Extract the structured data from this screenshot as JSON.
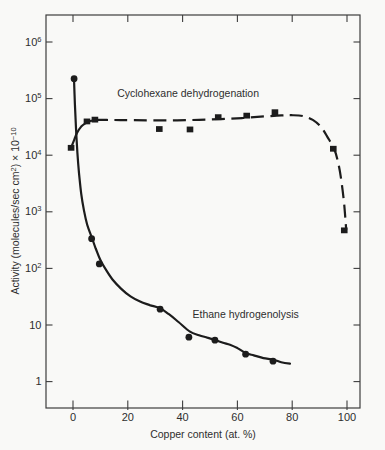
{
  "chart_data": {
    "type": "scatter-line",
    "title": "",
    "xlabel": "Copper content (at. %)",
    "ylabel_parts": [
      {
        "t": "Activity (molecules/sec cm",
        "sup": false
      },
      {
        "t": "2",
        "sup": true
      },
      {
        "t": ")  ×  10",
        "sup": false
      },
      {
        "t": "−10",
        "sup": true
      }
    ],
    "x_axis": {
      "ticks": [
        0,
        20,
        40,
        60,
        80,
        100
      ],
      "labels": [
        "0",
        "20",
        "40",
        "60",
        "80",
        "100"
      ]
    },
    "y_axis": {
      "scale": "log",
      "ticks": [
        {
          "log": 6,
          "text": "10",
          "sup": "6"
        },
        {
          "log": 5,
          "text": "10",
          "sup": "5"
        },
        {
          "log": 4,
          "text": "10",
          "sup": "4"
        },
        {
          "log": 3,
          "text": "10",
          "sup": "3"
        },
        {
          "log": 2,
          "text": "10",
          "sup": "2"
        },
        {
          "log": 1,
          "text": "10",
          "sup": ""
        },
        {
          "log": 0,
          "text": "1",
          "sup": ""
        }
      ]
    },
    "xlim": [
      -9.8,
      104.7
    ],
    "ylog_lim": [
      -0.46,
      6.48
    ],
    "grid": false,
    "legend": "inline-annotations",
    "series": [
      {
        "name": "Cyclohexane dehydrogenation",
        "marker": "square",
        "line_style": "solid-then-dashed",
        "points": [
          [
            -0.7,
            13500
          ],
          [
            5.1,
            39500
          ],
          [
            8,
            42500
          ],
          [
            31.5,
            29000
          ],
          [
            42.7,
            28500
          ],
          [
            53,
            47000
          ],
          [
            63.4,
            50000
          ],
          [
            73.7,
            57500
          ],
          [
            95,
            13000
          ],
          [
            99,
            470
          ]
        ],
        "curve_solid": [
          [
            -0.7,
            13500
          ],
          [
            0.5,
            19000
          ],
          [
            1.5,
            25000
          ],
          [
            3,
            32000
          ],
          [
            4.5,
            36500
          ],
          [
            6,
            39500
          ],
          [
            8,
            42000
          ]
        ],
        "curve_dashed": [
          [
            8,
            42000
          ],
          [
            15,
            41800
          ],
          [
            22,
            41500
          ],
          [
            30,
            41200
          ],
          [
            38,
            41200
          ],
          [
            46,
            42200
          ],
          [
            54,
            43500
          ],
          [
            62,
            45500
          ],
          [
            70,
            48500
          ],
          [
            76,
            50500
          ],
          [
            80,
            51000
          ],
          [
            84,
            49000
          ],
          [
            87.5,
            42000
          ],
          [
            90.5,
            31500
          ],
          [
            93,
            20500
          ],
          [
            95.3,
            13000
          ],
          [
            96.8,
            7300
          ],
          [
            98,
            3400
          ],
          [
            99,
            1300
          ],
          [
            99.7,
            480
          ]
        ],
        "label": {
          "text": "Cyclohexane dehydrogenation",
          "x": 42,
          "y": 105000
        }
      },
      {
        "name": "Ethane hydrogenolysis",
        "marker": "circle",
        "line_style": "solid",
        "points": [
          [
            0.4,
            225000
          ],
          [
            6.8,
            335
          ],
          [
            9.6,
            120
          ],
          [
            31.8,
            19
          ],
          [
            42.3,
            6.1
          ],
          [
            51.8,
            5.4
          ],
          [
            63,
            3.05
          ],
          [
            73,
            2.3
          ]
        ],
        "curve_solid": [
          [
            0.35,
            225000
          ],
          [
            0.7,
            80000
          ],
          [
            1.1,
            30000
          ],
          [
            1.6,
            11000
          ],
          [
            2.2,
            4800
          ],
          [
            3.0,
            2100
          ],
          [
            4.0,
            1050
          ],
          [
            5.2,
            590
          ],
          [
            6.8,
            360
          ],
          [
            8.3,
            225
          ],
          [
            10,
            140
          ],
          [
            12,
            95
          ],
          [
            14.5,
            63
          ],
          [
            17.5,
            44
          ],
          [
            21,
            32
          ],
          [
            24.5,
            26
          ],
          [
            28,
            22.5
          ],
          [
            31.8,
            19.7
          ],
          [
            35,
            15.5
          ],
          [
            38.5,
            11.3
          ],
          [
            42.7,
            7.6
          ],
          [
            46,
            6.6
          ],
          [
            49,
            6.0
          ],
          [
            51.8,
            5.45
          ],
          [
            54.5,
            4.9
          ],
          [
            57.3,
            4.46
          ],
          [
            60,
            3.9
          ],
          [
            63,
            3.2
          ],
          [
            66,
            2.9
          ],
          [
            69.5,
            2.6
          ],
          [
            73.1,
            2.44
          ],
          [
            76,
            2.2
          ],
          [
            79.2,
            2.07
          ]
        ],
        "curve_dashed": [],
        "label": {
          "text": "Ethane hydrogenolysis",
          "x": 63,
          "y": 13.5
        }
      }
    ],
    "colors": {
      "ink": "#1c1c1c",
      "axis": "#3d3d3d",
      "text": "#2e2e2e",
      "background": "#f9f9f7"
    }
  }
}
